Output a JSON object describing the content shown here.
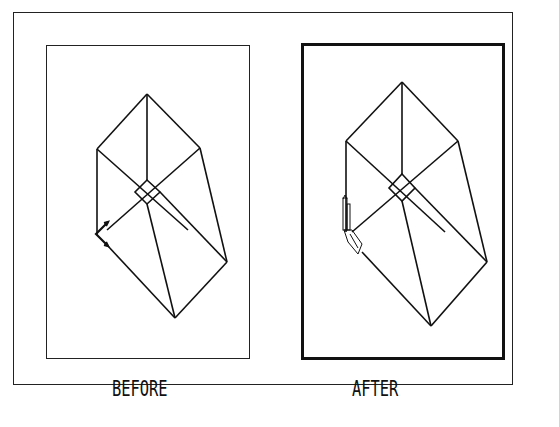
{
  "figure": {
    "panels": [
      {
        "id": "before",
        "label": "BEFORE",
        "frame_border": "thin"
      },
      {
        "id": "after",
        "label": "AFTER",
        "frame_border": "thick"
      }
    ]
  },
  "colors": {
    "line": "#111111",
    "background": "#ffffff"
  }
}
